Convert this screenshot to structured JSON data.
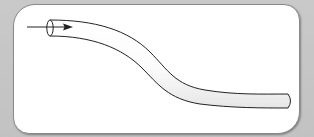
{
  "diagram": {
    "type": "pipe-flow",
    "elements": [
      {
        "id": "tube",
        "shape": "s-curved cylinder",
        "start": "left (open end)",
        "end": "right (closed rounded cap)"
      },
      {
        "id": "flow-arrow",
        "direction": "right",
        "position": "entering tube opening at left"
      }
    ],
    "labels": []
  },
  "colors": {
    "background": "#c6c6c6",
    "panel": "#ffffff",
    "panel_border": "#8a8a8a",
    "stroke": "#222222",
    "tube_shade": "#e8e8e8"
  }
}
